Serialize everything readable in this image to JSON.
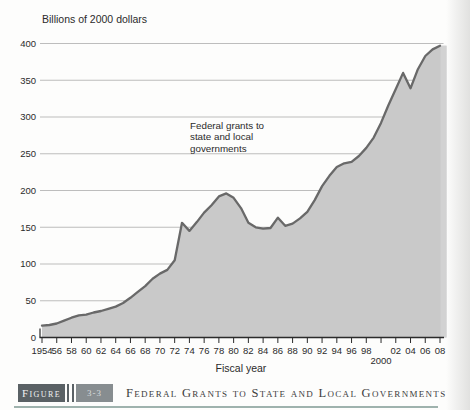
{
  "chart": {
    "title": "Billions of 2000 dollars",
    "xlabel": "Fiscal year",
    "annotation_lines": [
      "Federal grants to",
      "state and local",
      "governments"
    ]
  },
  "chart_data": {
    "type": "area",
    "title": "Billions of 2000 dollars",
    "xlabel": "Fiscal year",
    "ylabel": "Billions of 2000 dollars",
    "series_label": "Federal grants to state and local governments",
    "x": [
      1954,
      1955,
      1956,
      1957,
      1958,
      1959,
      1960,
      1961,
      1962,
      1963,
      1964,
      1965,
      1966,
      1967,
      1968,
      1969,
      1970,
      1971,
      1972,
      1973,
      1974,
      1975,
      1976,
      1977,
      1978,
      1979,
      1980,
      1981,
      1982,
      1983,
      1984,
      1985,
      1986,
      1987,
      1988,
      1989,
      1990,
      1991,
      1992,
      1993,
      1994,
      1995,
      1996,
      1997,
      1998,
      1999,
      2000,
      2001,
      2002,
      2003,
      2004,
      2005,
      2006,
      2007,
      2008
    ],
    "values": [
      16,
      17,
      19,
      23,
      27,
      30,
      31,
      34,
      36,
      39,
      42,
      47,
      54,
      62,
      70,
      80,
      87,
      92,
      105,
      156,
      145,
      157,
      170,
      180,
      192,
      196,
      190,
      176,
      156,
      150,
      148,
      149,
      163,
      152,
      155,
      162,
      171,
      187,
      206,
      220,
      232,
      237,
      239,
      247,
      258,
      272,
      292,
      316,
      338,
      360,
      339,
      365,
      383,
      392,
      397
    ],
    "xlim": [
      1954,
      2008
    ],
    "ylim": [
      0,
      400
    ],
    "grid": true,
    "legend_position": "none",
    "yticks": [
      0,
      50,
      100,
      150,
      200,
      250,
      300,
      350,
      400
    ],
    "xticks": [
      {
        "year": 1954,
        "label": "1954",
        "row": 1
      },
      {
        "year": 1956,
        "label": "56",
        "row": 1
      },
      {
        "year": 1958,
        "label": "58",
        "row": 1
      },
      {
        "year": 1960,
        "label": "60",
        "row": 1
      },
      {
        "year": 1962,
        "label": "62",
        "row": 1
      },
      {
        "year": 1964,
        "label": "64",
        "row": 1
      },
      {
        "year": 1966,
        "label": "66",
        "row": 1
      },
      {
        "year": 1968,
        "label": "68",
        "row": 1
      },
      {
        "year": 1970,
        "label": "70",
        "row": 1
      },
      {
        "year": 1972,
        "label": "72",
        "row": 1
      },
      {
        "year": 1974,
        "label": "74",
        "row": 1
      },
      {
        "year": 1976,
        "label": "76",
        "row": 1
      },
      {
        "year": 1978,
        "label": "78",
        "row": 1
      },
      {
        "year": 1980,
        "label": "80",
        "row": 1
      },
      {
        "year": 1982,
        "label": "82",
        "row": 1
      },
      {
        "year": 1984,
        "label": "84",
        "row": 1
      },
      {
        "year": 1986,
        "label": "86",
        "row": 1
      },
      {
        "year": 1988,
        "label": "88",
        "row": 1
      },
      {
        "year": 1990,
        "label": "90",
        "row": 1
      },
      {
        "year": 1992,
        "label": "92",
        "row": 1
      },
      {
        "year": 1994,
        "label": "94",
        "row": 1
      },
      {
        "year": 1996,
        "label": "96",
        "row": 1
      },
      {
        "year": 1998,
        "label": "98",
        "row": 1
      },
      {
        "year": 2000,
        "label": "2000",
        "row": 2
      },
      {
        "year": 2002,
        "label": "02",
        "row": 1
      },
      {
        "year": 2004,
        "label": "04",
        "row": 1
      },
      {
        "year": 2006,
        "label": "06",
        "row": 1
      },
      {
        "year": 2008,
        "label": "08",
        "row": 1
      }
    ],
    "colors": {
      "area_fill": "#c9c9c9",
      "area_fill_edge": "#d4d4d4",
      "line": "#696969",
      "grid": "#b6b6b6",
      "axis": "#2b2b2b",
      "text": "#2b2b2b"
    }
  },
  "caption": {
    "figure_label": "Figure",
    "figure_number": "3-3",
    "text": "Federal Grants to State and Local Governments",
    "accent_color": "#8da49f"
  }
}
